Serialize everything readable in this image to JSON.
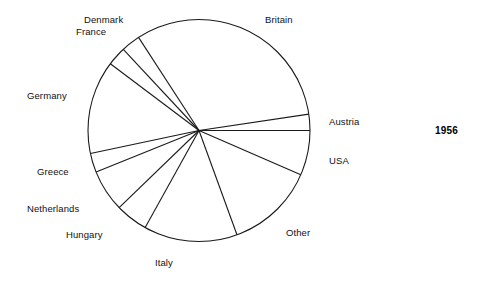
{
  "chart_data": {
    "type": "pie",
    "title": "",
    "subtitle": "",
    "xlabel": "",
    "ylabel": "",
    "legend_position": "none",
    "grid": false,
    "annotations": [
      "1956"
    ],
    "labels_placement": "outside-callout",
    "categories": [
      "Britain",
      "Austria",
      "USA",
      "Other",
      "Italy",
      "Hungary",
      "Netherlands",
      "Greece",
      "Germany",
      "France",
      "Denmark"
    ],
    "values": [
      31.0,
      2.4,
      6.5,
      12.9,
      13.6,
      4.7,
      6.1,
      2.8,
      7.0,
      6.9,
      6.1
    ],
    "unit": "percent",
    "slices": [
      {
        "label": "Britain",
        "value": 31.0,
        "start_angle_deg": 123.0,
        "end_angle_deg": 8.5
      },
      {
        "label": "Austria",
        "value": 2.4,
        "start_angle_deg": 8.5,
        "end_angle_deg": 0.0
      },
      {
        "label": "USA",
        "value": 6.5,
        "start_angle_deg": 0.0,
        "end_angle_deg": -23.5
      },
      {
        "label": "Other",
        "value": 12.9,
        "start_angle_deg": -23.5,
        "end_angle_deg": -70.0
      },
      {
        "label": "Italy",
        "value": 13.6,
        "start_angle_deg": -70.0,
        "end_angle_deg": -119.0
      },
      {
        "label": "Hungary",
        "value": 4.7,
        "start_angle_deg": -119.0,
        "end_angle_deg": -136.0
      },
      {
        "label": "Netherlands",
        "value": 6.1,
        "start_angle_deg": -136.0,
        "end_angle_deg": -158.0
      },
      {
        "label": "Greece",
        "value": 2.8,
        "start_angle_deg": -158.0,
        "end_angle_deg": -168.0
      },
      {
        "label": "Germany",
        "value": 7.0,
        "start_angle_deg": 192.0,
        "end_angle_deg": 143.0
      },
      {
        "label": "France",
        "value": 6.9,
        "start_angle_deg": 143.0,
        "end_angle_deg": 133.0
      },
      {
        "label": "Denmark",
        "value": 6.1,
        "start_angle_deg": 133.0,
        "end_angle_deg": 123.0
      }
    ],
    "geometry": {
      "center_x": 199,
      "center_y": 130.5,
      "radius": 111,
      "fill": "#ffffff",
      "stroke": "#1a1a1a",
      "stroke_width": 1.1
    }
  },
  "chart": {
    "year": "1956",
    "labels": [
      {
        "name": "denmark-label",
        "text": "Denmark",
        "x": 84,
        "y": 14
      },
      {
        "name": "france-label",
        "text": "France",
        "x": 76,
        "y": 26
      },
      {
        "name": "britain-label",
        "text": "Britain",
        "x": 265,
        "y": 14
      },
      {
        "name": "germany-label",
        "text": "Germany",
        "x": 27,
        "y": 90
      },
      {
        "name": "austria-label",
        "text": "Austria",
        "x": 329,
        "y": 116
      },
      {
        "name": "usa-label",
        "text": "USA",
        "x": 329,
        "y": 155
      },
      {
        "name": "greece-label",
        "text": "Greece",
        "x": 37,
        "y": 166
      },
      {
        "name": "netherlands-label",
        "text": "Netherlands",
        "x": 27,
        "y": 203
      },
      {
        "name": "hungary-label",
        "text": "Hungary",
        "x": 66,
        "y": 229
      },
      {
        "name": "other-label",
        "text": "Other",
        "x": 286,
        "y": 227
      },
      {
        "name": "italy-label",
        "text": "Italy",
        "x": 155,
        "y": 257
      }
    ]
  }
}
